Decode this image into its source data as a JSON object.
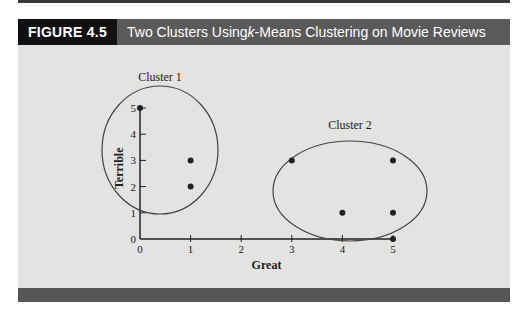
{
  "figure": {
    "label": "FIGURE 4.5",
    "title_prefix": "Two Clusters Using ",
    "title_italic": "k",
    "title_suffix": "-Means Clustering on Movie Reviews"
  },
  "colors": {
    "label_bg": "#111111",
    "title_bg": "#5a5a5a",
    "panel_bg": "#e3e3e1",
    "bar": "#555555",
    "ink": "#222222"
  },
  "chart_data": {
    "type": "scatter",
    "title": "Two Clusters Using k-Means Clustering on Movie Reviews",
    "xlabel": "Great",
    "ylabel": "Terrible",
    "xlim": [
      0,
      5
    ],
    "ylim": [
      0,
      5
    ],
    "x_ticks": [
      "0",
      "1",
      "2",
      "3",
      "4",
      "5"
    ],
    "y_ticks": [
      "0",
      "1",
      "2",
      "3",
      "4",
      "5"
    ],
    "grid": false,
    "points": [
      {
        "x": 0,
        "y": 5,
        "cluster": "Cluster 1"
      },
      {
        "x": 1,
        "y": 3,
        "cluster": "Cluster 1"
      },
      {
        "x": 1,
        "y": 2,
        "cluster": "Cluster 1"
      },
      {
        "x": 3,
        "y": 3,
        "cluster": "Cluster 2"
      },
      {
        "x": 5,
        "y": 3,
        "cluster": "Cluster 2"
      },
      {
        "x": 4,
        "y": 1,
        "cluster": "Cluster 2"
      },
      {
        "x": 5,
        "y": 1,
        "cluster": "Cluster 2"
      },
      {
        "x": 5,
        "y": 0,
        "cluster": "Cluster 2"
      }
    ],
    "clusters": [
      {
        "name": "Cluster 1",
        "label": "Cluster 1"
      },
      {
        "name": "Cluster 2",
        "label": "Cluster 2"
      }
    ]
  }
}
